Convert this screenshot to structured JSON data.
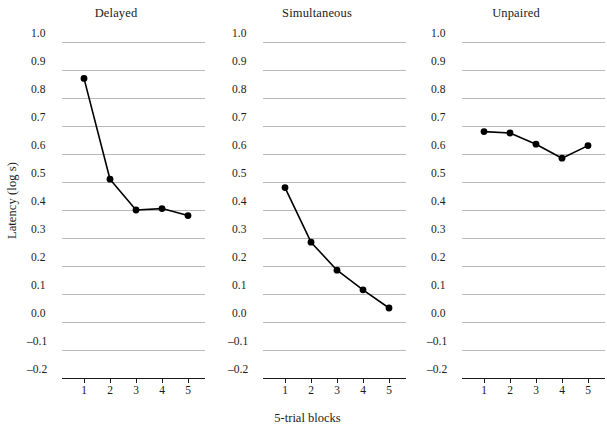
{
  "chart_data": {
    "type": "line",
    "title": "",
    "xlabel": "5-trial blocks",
    "ylabel": "Latency (log s)",
    "x": [
      1,
      2,
      3,
      4,
      5
    ],
    "xticklabels": [
      "1",
      "2",
      "3",
      "4",
      "5"
    ],
    "yticklabels": [
      "1.0",
      "0.9",
      "0.8",
      "0.7",
      "0.6",
      "0.5",
      "0.4",
      "0.3",
      "0.2",
      "0.1",
      "0.0",
      "–0.1",
      "–0.2"
    ],
    "ytickvalues": [
      1.0,
      0.9,
      0.8,
      0.7,
      0.6,
      0.5,
      0.4,
      0.3,
      0.2,
      0.1,
      0.0,
      -0.1,
      -0.2
    ],
    "ylim": [
      -0.2,
      1.0
    ],
    "xlim": [
      0.5,
      5.5
    ],
    "grid": "horizontal",
    "legend": "none",
    "marker": "filled-circle",
    "line_color": "#000000",
    "grid_color": "#b9b9b9",
    "panels": [
      {
        "title": "Delayed",
        "values": [
          0.87,
          0.51,
          0.4,
          0.405,
          0.38
        ]
      },
      {
        "title": "Simultaneous",
        "values": [
          0.48,
          0.285,
          0.185,
          0.115,
          0.05
        ]
      },
      {
        "title": "Unpaired",
        "values": [
          0.68,
          0.675,
          0.635,
          0.585,
          0.63
        ]
      }
    ]
  }
}
